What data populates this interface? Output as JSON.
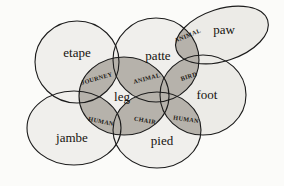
{
  "figure": {
    "type": "venn-ellipse-diagram",
    "background_color": "#fbfbf9",
    "ellipse_fill_color": "#f0efec",
    "intersection_fill_color": "#b6b2ab",
    "outline_color": "#1b1b1b"
  },
  "sets": [
    {
      "id": "etape",
      "label": "etape",
      "cx": 77,
      "cy": 62,
      "rx": 42,
      "ry": 41,
      "rotate": 0,
      "label_x": 77,
      "label_y": 54
    },
    {
      "id": "patte",
      "label": "patte",
      "cx": 156,
      "cy": 60,
      "rx": 43,
      "ry": 42,
      "rotate": 0,
      "label_x": 158,
      "label_y": 57
    },
    {
      "id": "paw",
      "label": "paw",
      "cx": 222,
      "cy": 35,
      "rx": 48,
      "ry": 26,
      "rotate": -18,
      "label_x": 224,
      "label_y": 31
    },
    {
      "id": "leg",
      "label": "leg",
      "cx": 124,
      "cy": 96,
      "rx": 45,
      "ry": 39,
      "rotate": 0,
      "label_x": 122,
      "label_y": 98
    },
    {
      "id": "foot",
      "label": "foot",
      "cx": 203,
      "cy": 95,
      "rx": 43,
      "ry": 40,
      "rotate": 0,
      "label_x": 207,
      "label_y": 96
    },
    {
      "id": "jambe",
      "label": "jambe",
      "cx": 74,
      "cy": 128,
      "rx": 47,
      "ry": 37,
      "rotate": 0,
      "label_x": 72,
      "label_y": 139
    },
    {
      "id": "pied",
      "label": "pied",
      "cx": 157,
      "cy": 130,
      "rx": 44,
      "ry": 38,
      "rotate": 0,
      "label_x": 162,
      "label_y": 142
    }
  ],
  "intersections": [
    {
      "id": "journey",
      "label": "JOURNEY",
      "between": [
        "etape",
        "leg"
      ],
      "label_x": 97,
      "label_y": 79,
      "rotate": -16
    },
    {
      "id": "animal-center",
      "label": "ANIMAL",
      "between": [
        "patte",
        "leg"
      ],
      "label_x": 147,
      "label_y": 79,
      "rotate": -15
    },
    {
      "id": "animal-paw",
      "label": "ANIMAL",
      "between": [
        "patte",
        "paw"
      ],
      "label_x": 188,
      "label_y": 36,
      "rotate": -22
    },
    {
      "id": "bird",
      "label": "BIRD",
      "between": [
        "patte",
        "foot"
      ],
      "label_x": 189,
      "label_y": 77,
      "rotate": -18
    },
    {
      "id": "human-left",
      "label": "HUMAN",
      "between": [
        "jambe",
        "leg"
      ],
      "label_x": 101,
      "label_y": 122,
      "rotate": 12
    },
    {
      "id": "chair",
      "label": "CHAIR",
      "between": [
        "leg",
        "pied"
      ],
      "label_x": 145,
      "label_y": 121,
      "rotate": 10
    },
    {
      "id": "human-right",
      "label": "HUMAN",
      "between": [
        "pied",
        "foot"
      ],
      "label_x": 186,
      "label_y": 120,
      "rotate": 8
    }
  ]
}
